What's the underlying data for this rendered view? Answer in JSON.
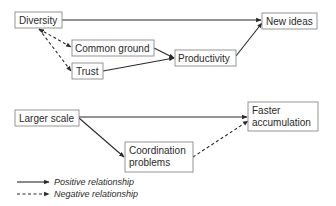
{
  "diagram": {
    "nodes": [
      {
        "id": "diversity",
        "lines": [
          "Diversity"
        ]
      },
      {
        "id": "common_ground",
        "lines": [
          "Common ground"
        ]
      },
      {
        "id": "trust",
        "lines": [
          "Trust"
        ]
      },
      {
        "id": "productivity",
        "lines": [
          "Productivity"
        ]
      },
      {
        "id": "new_ideas",
        "lines": [
          "New ideas"
        ]
      },
      {
        "id": "larger_scale",
        "lines": [
          "Larger scale"
        ]
      },
      {
        "id": "coordination_problems",
        "lines": [
          "Coordination",
          "problems"
        ]
      },
      {
        "id": "faster_accumulation",
        "lines": [
          "Faster",
          "accumulation"
        ]
      }
    ],
    "edges": [
      {
        "from": "diversity",
        "to": "new_ideas",
        "type": "positive"
      },
      {
        "from": "diversity",
        "to": "common_ground",
        "type": "negative",
        "bidirectional": true
      },
      {
        "from": "diversity",
        "to": "trust",
        "type": "negative",
        "bidirectional": true
      },
      {
        "from": "common_ground",
        "to": "productivity",
        "type": "positive"
      },
      {
        "from": "trust",
        "to": "productivity",
        "type": "positive"
      },
      {
        "from": "productivity",
        "to": "new_ideas",
        "type": "positive"
      },
      {
        "from": "larger_scale",
        "to": "faster_accumulation",
        "type": "positive"
      },
      {
        "from": "larger_scale",
        "to": "coordination_problems",
        "type": "positive"
      },
      {
        "from": "coordination_problems",
        "to": "faster_accumulation",
        "type": "negative"
      }
    ],
    "legend": {
      "positive": "Positive relationship",
      "negative": "Negative relationship"
    }
  }
}
